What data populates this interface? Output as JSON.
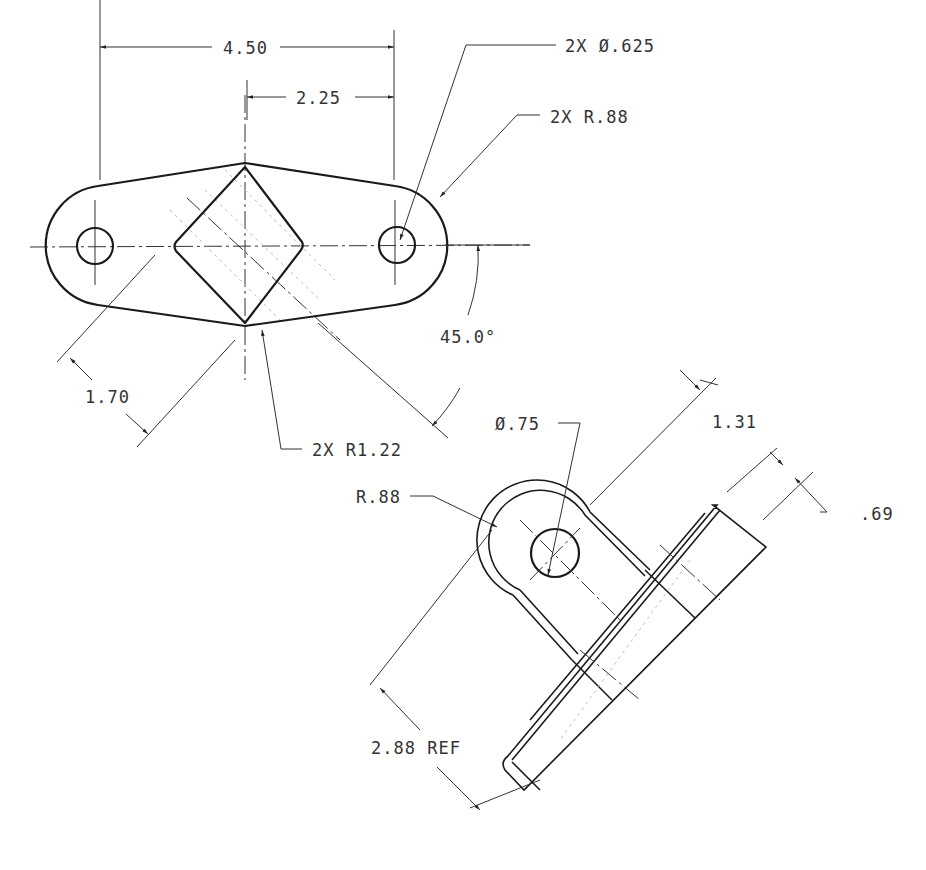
{
  "drawing": {
    "type": "engineering-drawing",
    "views": [
      {
        "name": "top-view",
        "description": "flat plate with two end holes and diamond center cutout"
      },
      {
        "name": "auxiliary-view",
        "description": "bent bracket with eye at 45 degrees"
      }
    ],
    "dimensions": {
      "overall_hole_spacing": "4.50",
      "half_hole_spacing": "2.25",
      "hole_diameter": "2X Ø.625",
      "end_radius": "2X R.88",
      "angle": "45.0°",
      "diamond_width": "1.70",
      "waist_radius": "2X R1.22",
      "eye_hole_diameter": "Ø.75",
      "eye_offset": "1.31",
      "eye_radius": "R.88",
      "flange_thickness": ".69",
      "reference_length": "2.88 REF"
    }
  }
}
